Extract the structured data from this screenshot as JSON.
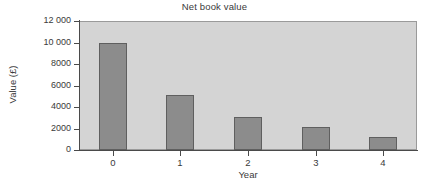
{
  "chart_data": {
    "type": "bar",
    "title": "Net book value",
    "xlabel": "Year",
    "ylabel": "Value (£)",
    "categories": [
      "0",
      "1",
      "2",
      "3",
      "4"
    ],
    "values": [
      10000,
      5100,
      3100,
      2100,
      1200
    ],
    "ylim": [
      0,
      12000
    ],
    "ytick_values": [
      0,
      2000,
      4000,
      6000,
      8000,
      10000,
      12000
    ],
    "ytick_labels": [
      "0",
      "2000",
      "4000",
      "6000",
      "8000",
      "10 000",
      "12 000"
    ],
    "grid": false,
    "legend": null,
    "colors": {
      "bar_fill": "#8c8c8c",
      "bar_border": "#5f5f5f",
      "plot_background": "#d4d4d4",
      "axis": "#4a4a4a",
      "text": "#3a3a3a",
      "canvas_background": "#ffffff"
    }
  }
}
